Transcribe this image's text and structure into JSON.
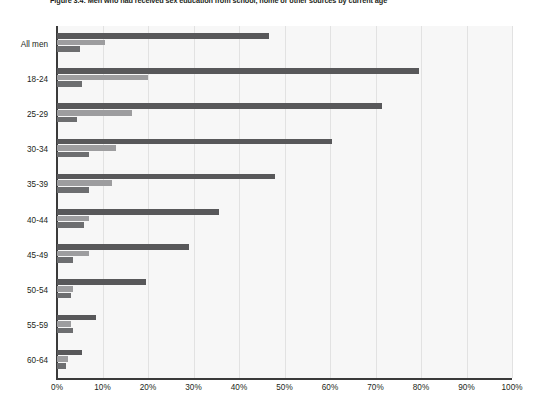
{
  "figure": {
    "title": "Figure 3.4: Men who had received sex education from school, home or other sources by current age"
  },
  "chart_data": {
    "type": "bar",
    "orientation": "horizontal",
    "title": "Figure 3.4: Men who had received sex education from school, home or other sources by current age",
    "xlabel": "",
    "ylabel": "",
    "xlim": [
      0,
      100
    ],
    "xticks": [
      "0%",
      "10%",
      "20%",
      "30%",
      "40%",
      "50%",
      "60%",
      "70%",
      "80%",
      "90%",
      "100%"
    ],
    "xtick_values": [
      0,
      10,
      20,
      30,
      40,
      50,
      60,
      70,
      80,
      90,
      100
    ],
    "grid": true,
    "legend": "none",
    "categories": [
      "All men",
      "18-24",
      "25-29",
      "30-34",
      "35-39",
      "40-44",
      "45-49",
      "50-54",
      "55-59",
      "60-64"
    ],
    "series": [
      {
        "name": "School",
        "color": "#58585a",
        "values": [
          46.5,
          79.5,
          71.5,
          60.5,
          48.0,
          35.5,
          29.0,
          19.5,
          8.5,
          5.5
        ]
      },
      {
        "name": "Home",
        "color": "#9d9d9f",
        "values": [
          10.5,
          20.0,
          16.5,
          13.0,
          12.0,
          7.0,
          7.0,
          3.5,
          3.0,
          2.5
        ]
      },
      {
        "name": "Other sources",
        "color": "#6d6e70",
        "values": [
          5.0,
          5.5,
          4.5,
          7.0,
          7.0,
          6.0,
          3.5,
          3.0,
          3.5,
          2.0
        ]
      }
    ]
  }
}
